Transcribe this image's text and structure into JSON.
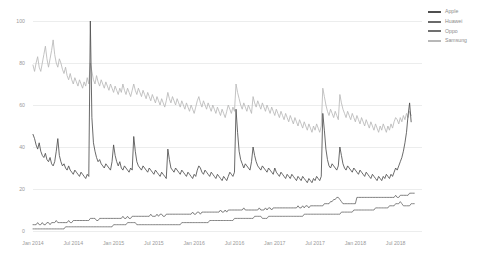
{
  "chart_data": {
    "type": "line",
    "title": "",
    "subtitle": "",
    "xlabel": "",
    "ylabel": "",
    "ylim": [
      0,
      100
    ],
    "grid": true,
    "legend_position": "top-right",
    "y_ticks": [
      "0",
      "20",
      "40",
      "60",
      "80",
      "100"
    ],
    "y_tick_values": [
      0,
      20,
      40,
      60,
      80,
      100
    ],
    "x_ticks": [
      "Jan 2014",
      "Jul 2014",
      "Jan 2015",
      "Jul 2015",
      "Jan 2016",
      "Jul 2016",
      "Jan 2017",
      "Jul 2017",
      "Jan 2018",
      "Jul 2018"
    ],
    "x_tick_index": [
      0,
      26,
      52,
      78,
      104,
      130,
      156,
      182,
      208,
      234
    ],
    "n_points": 252,
    "series": [
      {
        "name": "Apple",
        "color": "#4f4f4f",
        "values": [
          46,
          44,
          41,
          39,
          42,
          38,
          36,
          35,
          37,
          34,
          33,
          35,
          32,
          31,
          33,
          38,
          44,
          36,
          33,
          31,
          32,
          30,
          29,
          31,
          29,
          28,
          27,
          29,
          28,
          27,
          26,
          28,
          27,
          26,
          25,
          27,
          26,
          100,
          54,
          42,
          38,
          35,
          33,
          34,
          32,
          31,
          30,
          32,
          31,
          30,
          29,
          33,
          41,
          36,
          33,
          31,
          33,
          30,
          29,
          31,
          30,
          29,
          28,
          30,
          29,
          45,
          38,
          33,
          31,
          30,
          29,
          31,
          30,
          29,
          28,
          30,
          29,
          28,
          27,
          29,
          28,
          27,
          26,
          28,
          27,
          26,
          25,
          39,
          34,
          30,
          29,
          28,
          30,
          29,
          28,
          27,
          29,
          28,
          27,
          26,
          28,
          27,
          26,
          25,
          27,
          26,
          29,
          31,
          30,
          28,
          27,
          29,
          28,
          27,
          26,
          28,
          27,
          26,
          25,
          27,
          26,
          25,
          24,
          26,
          25,
          24,
          26,
          28,
          27,
          26,
          28,
          58,
          47,
          38,
          34,
          32,
          30,
          32,
          31,
          30,
          29,
          33,
          40,
          36,
          33,
          31,
          30,
          29,
          31,
          30,
          29,
          28,
          30,
          29,
          28,
          27,
          30,
          28,
          27,
          26,
          28,
          27,
          26,
          25,
          27,
          26,
          25,
          27,
          26,
          25,
          24,
          26,
          25,
          24,
          26,
          25,
          24,
          23,
          25,
          24,
          23,
          25,
          24,
          26,
          25,
          24,
          26,
          56,
          48,
          39,
          34,
          31,
          30,
          32,
          31,
          30,
          29,
          31,
          40,
          36,
          32,
          30,
          29,
          31,
          30,
          29,
          28,
          30,
          29,
          28,
          27,
          29,
          28,
          27,
          26,
          28,
          27,
          26,
          25,
          27,
          26,
          25,
          24,
          26,
          25,
          24,
          26,
          25,
          27,
          26,
          25,
          27,
          26,
          28,
          30,
          29,
          31,
          33,
          35,
          38,
          42,
          47,
          55,
          61,
          52
        ]
      },
      {
        "name": "Huawei",
        "color": "#6a6a6a",
        "values": [
          3,
          3,
          3,
          4,
          3,
          3,
          4,
          3,
          3,
          4,
          4,
          3,
          4,
          4,
          4,
          5,
          4,
          4,
          4,
          4,
          4,
          4,
          4,
          5,
          4,
          4,
          5,
          5,
          5,
          5,
          5,
          5,
          5,
          5,
          5,
          5,
          5,
          6,
          6,
          6,
          6,
          5,
          5,
          6,
          6,
          6,
          6,
          6,
          6,
          6,
          6,
          6,
          6,
          6,
          6,
          6,
          6,
          6,
          7,
          6,
          6,
          7,
          6,
          6,
          7,
          7,
          7,
          7,
          7,
          7,
          7,
          7,
          7,
          7,
          7,
          7,
          8,
          7,
          7,
          7,
          8,
          7,
          8,
          8,
          7,
          7,
          8,
          8,
          8,
          8,
          8,
          8,
          8,
          8,
          8,
          8,
          8,
          8,
          8,
          8,
          8,
          8,
          8,
          9,
          8,
          8,
          9,
          9,
          8,
          9,
          9,
          9,
          9,
          9,
          9,
          9,
          9,
          9,
          9,
          9,
          9,
          10,
          9,
          9,
          10,
          9,
          10,
          10,
          10,
          10,
          10,
          10,
          10,
          10,
          10,
          10,
          11,
          10,
          10,
          10,
          10,
          10,
          10,
          10,
          10,
          10,
          11,
          10,
          10,
          10,
          11,
          10,
          11,
          11,
          10,
          11,
          11,
          11,
          11,
          11,
          11,
          11,
          11,
          11,
          11,
          11,
          11,
          11,
          11,
          11,
          11,
          12,
          11,
          11,
          12,
          11,
          12,
          12,
          11,
          12,
          12,
          12,
          12,
          12,
          12,
          12,
          12,
          12,
          13,
          13,
          13,
          13,
          14,
          14,
          15,
          15,
          16,
          16,
          15,
          14,
          13,
          13,
          13,
          13,
          13,
          13,
          13,
          13,
          13,
          16,
          16,
          16,
          16,
          16,
          16,
          16,
          16,
          16,
          16,
          16,
          16,
          16,
          16,
          16,
          16,
          16,
          16,
          16,
          16,
          16,
          16,
          16,
          16,
          16,
          17,
          16,
          16,
          17,
          17,
          17,
          17,
          17,
          17,
          18,
          18,
          18,
          18
        ]
      },
      {
        "name": "Oppo",
        "color": "#707070",
        "values": [
          1,
          1,
          1,
          1,
          1,
          1,
          1,
          1,
          1,
          1,
          1,
          1,
          1,
          1,
          1,
          1,
          1,
          1,
          1,
          1,
          1,
          2,
          2,
          2,
          2,
          2,
          2,
          2,
          2,
          2,
          2,
          2,
          2,
          2,
          2,
          2,
          2,
          2,
          2,
          2,
          2,
          2,
          2,
          2,
          2,
          2,
          2,
          2,
          2,
          2,
          2,
          2,
          3,
          3,
          3,
          3,
          3,
          3,
          3,
          3,
          3,
          4,
          4,
          4,
          4,
          4,
          4,
          3,
          3,
          3,
          3,
          3,
          3,
          3,
          3,
          3,
          3,
          3,
          3,
          3,
          3,
          3,
          3,
          3,
          3,
          3,
          3,
          3,
          3,
          3,
          3,
          3,
          3,
          3,
          3,
          3,
          4,
          4,
          4,
          4,
          4,
          4,
          4,
          4,
          4,
          4,
          4,
          4,
          4,
          4,
          4,
          4,
          4,
          4,
          5,
          5,
          5,
          5,
          5,
          5,
          5,
          5,
          5,
          5,
          5,
          5,
          5,
          5,
          5,
          5,
          6,
          6,
          6,
          6,
          6,
          6,
          6,
          6,
          6,
          6,
          6,
          6,
          6,
          7,
          7,
          7,
          7,
          7,
          6,
          6,
          6,
          6,
          7,
          7,
          7,
          7,
          7,
          7,
          7,
          7,
          7,
          7,
          7,
          7,
          7,
          7,
          7,
          7,
          7,
          7,
          7,
          7,
          7,
          7,
          7,
          8,
          8,
          8,
          8,
          8,
          8,
          8,
          8,
          8,
          8,
          8,
          8,
          8,
          8,
          8,
          8,
          8,
          8,
          8,
          8,
          8,
          8,
          8,
          8,
          9,
          9,
          9,
          9,
          9,
          9,
          9,
          9,
          10,
          10,
          10,
          10,
          10,
          10,
          10,
          10,
          10,
          10,
          10,
          10,
          10,
          10,
          11,
          11,
          11,
          11,
          11,
          11,
          11,
          11,
          11,
          12,
          12,
          12,
          12,
          13,
          13,
          13,
          14,
          13,
          12,
          12,
          12,
          12,
          12,
          13,
          13,
          13
        ]
      },
      {
        "name": "Samsung",
        "color": "#b8b8b8",
        "values": [
          79,
          76,
          80,
          83,
          78,
          76,
          80,
          84,
          88,
          82,
          78,
          82,
          86,
          91,
          84,
          80,
          78,
          82,
          80,
          77,
          75,
          78,
          74,
          72,
          75,
          72,
          70,
          73,
          71,
          69,
          72,
          70,
          68,
          71,
          69,
          73,
          70,
          80,
          76,
          72,
          70,
          74,
          71,
          69,
          72,
          70,
          68,
          71,
          69,
          67,
          70,
          68,
          66,
          69,
          67,
          65,
          68,
          66,
          70,
          67,
          65,
          68,
          66,
          64,
          67,
          70,
          67,
          65,
          68,
          66,
          64,
          67,
          65,
          63,
          66,
          64,
          62,
          65,
          63,
          61,
          64,
          62,
          60,
          63,
          61,
          59,
          62,
          66,
          63,
          61,
          64,
          62,
          60,
          63,
          61,
          59,
          62,
          60,
          58,
          61,
          59,
          57,
          60,
          58,
          56,
          59,
          62,
          64,
          61,
          59,
          62,
          60,
          58,
          61,
          59,
          57,
          60,
          58,
          56,
          59,
          57,
          55,
          58,
          56,
          54,
          57,
          60,
          58,
          56,
          59,
          57,
          70,
          66,
          63,
          60,
          58,
          61,
          59,
          57,
          60,
          58,
          56,
          64,
          61,
          59,
          62,
          60,
          58,
          61,
          59,
          57,
          60,
          58,
          56,
          59,
          57,
          55,
          58,
          56,
          54,
          57,
          55,
          53,
          56,
          54,
          52,
          55,
          53,
          51,
          54,
          52,
          50,
          53,
          51,
          49,
          52,
          50,
          48,
          51,
          49,
          47,
          50,
          48,
          51,
          49,
          47,
          50,
          68,
          64,
          60,
          57,
          55,
          58,
          56,
          54,
          57,
          55,
          53,
          65,
          61,
          58,
          56,
          54,
          57,
          55,
          53,
          56,
          54,
          52,
          55,
          53,
          51,
          54,
          52,
          50,
          53,
          51,
          49,
          52,
          50,
          48,
          51,
          49,
          47,
          50,
          48,
          51,
          49,
          47,
          50,
          48,
          51,
          49,
          52,
          54,
          53,
          51,
          54,
          52,
          55,
          53,
          56,
          54,
          57,
          55
        ]
      }
    ]
  },
  "legend": {
    "items": [
      {
        "label": "Apple",
        "color": "#4f4f4f"
      },
      {
        "label": "Huawei",
        "color": "#6a6a6a"
      },
      {
        "label": "Oppo",
        "color": "#707070"
      },
      {
        "label": "Samsung",
        "color": "#b8b8b8"
      }
    ]
  }
}
